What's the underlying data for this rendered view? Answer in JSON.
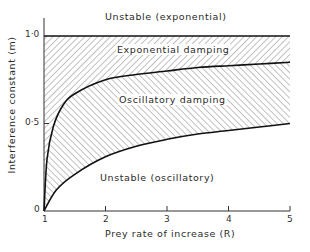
{
  "chart_data": {
    "type": "area",
    "title": "",
    "xlabel": "Prey rate of increase (R)",
    "ylabel": "Interference constant (m)",
    "xlim": [
      1,
      5
    ],
    "ylim": [
      0,
      1.1
    ],
    "xticks": [
      "1",
      "2",
      "3",
      "4",
      "5"
    ],
    "yticks": [
      "0",
      "0·5",
      "1·0"
    ],
    "grid": false,
    "legend": "none",
    "series": [
      {
        "name": "Upper stability boundary (m = 1)",
        "x": [
          1,
          2,
          3,
          4,
          5
        ],
        "values": [
          1.0,
          1.0,
          1.0,
          1.0,
          1.0
        ]
      },
      {
        "name": "Exponential / oscillatory damping boundary",
        "x": [
          1,
          1.05,
          1.15,
          1.3,
          1.5,
          2,
          2.5,
          3,
          3.5,
          4,
          4.5,
          5
        ],
        "values": [
          0,
          0.3,
          0.48,
          0.6,
          0.67,
          0.75,
          0.78,
          0.8,
          0.82,
          0.83,
          0.84,
          0.85
        ]
      },
      {
        "name": "Lower stability boundary",
        "x": [
          1,
          1.2,
          1.5,
          2,
          2.5,
          3,
          3.5,
          4,
          4.5,
          5
        ],
        "values": [
          0,
          0.12,
          0.21,
          0.31,
          0.37,
          0.41,
          0.44,
          0.46,
          0.48,
          0.5
        ]
      }
    ],
    "annotations": [
      {
        "text": "Unstable (exponential)",
        "region": "above m = 1"
      },
      {
        "text": "Exponential damping",
        "region": "between m = 1 and damping boundary"
      },
      {
        "text": "Oscillatory damping",
        "region": "between damping boundary and lower boundary"
      },
      {
        "text": "Unstable (oscillatory)",
        "region": "below lower boundary"
      }
    ]
  },
  "labels": {
    "unstable_exp": "Unstable (exponential)",
    "exp_damping": "Exponential damping",
    "osc_damping": "Oscillatory damping",
    "unstable_osc": "Unstable (oscillatory)",
    "xlabel": "Prey rate of increase (R)",
    "ylabel": "Interference constant (m)",
    "xticks": [
      "1",
      "2",
      "3",
      "4",
      "5"
    ],
    "yticks": [
      "0",
      "0·5",
      "1·0"
    ]
  }
}
